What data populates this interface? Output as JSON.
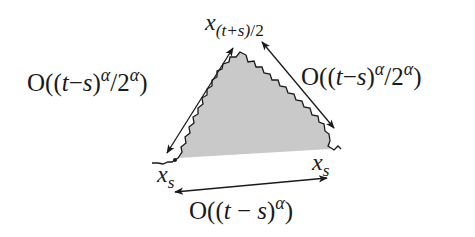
{
  "diagram": {
    "type": "triangle-with-rough-edges",
    "fill_color": "#c8c8c8",
    "stroke_color": "#1a1a1a",
    "vertices": {
      "apex": {
        "label_var": "x",
        "label_sub": "(t+s)/2",
        "label_suffix": ""
      },
      "base_left": {
        "label_var": "x",
        "label_sub": "s"
      },
      "base_right": {
        "label_var": "x",
        "label_sub": "s"
      }
    },
    "labels": {
      "top": {
        "var": "x",
        "sub": "(t+s)",
        "rest": "/2"
      },
      "left_side": {
        "prefix": "O((",
        "t": "t",
        "minus": "−",
        "s": "s",
        "close": ")",
        "sup1": "α",
        "mid": "/2",
        "sup2": "α",
        "end": ")"
      },
      "right_side": {
        "prefix": "O((",
        "t": "t",
        "minus": "−",
        "s": "s",
        "close": ")",
        "sup1": "α",
        "mid": "/2",
        "sup2": "α",
        "end": ")"
      },
      "bottom": {
        "prefix": "O((",
        "t": "t",
        "minus": " −",
        "s": "s",
        "close": ")",
        "sup1": "α",
        "end": ")"
      },
      "xs_left": {
        "var": "x",
        "sub": "s"
      },
      "xs_right": {
        "var": "x",
        "sub": "s"
      }
    },
    "arrows": [
      {
        "name": "left-side-arrow",
        "from": [
          167,
          153
        ],
        "to": [
          233,
          48
        ],
        "double_headed": true
      },
      {
        "name": "right-side-arrow",
        "from": [
          262,
          42
        ],
        "to": [
          334,
          128
        ],
        "double_headed": true
      },
      {
        "name": "bottom-arrow",
        "from": [
          175,
          192
        ],
        "to": [
          327,
          178
        ],
        "double_headed": true
      }
    ]
  }
}
